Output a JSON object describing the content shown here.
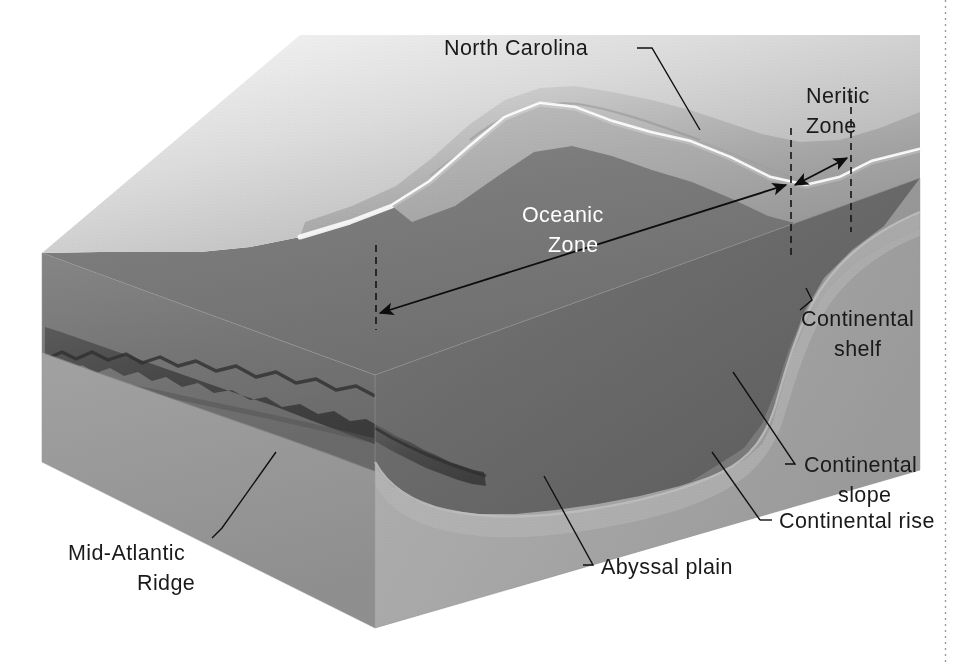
{
  "figure": {
    "background_color": "#ffffff",
    "width": 956,
    "height": 663
  },
  "palette": {
    "land_light": "#e8e8e8",
    "land_mid": "#c9c9c9",
    "land_shadow": "#9f9f9f",
    "coast_highlight": "#fdfdfd",
    "water_surface_top": "#b9b9b9",
    "water_surface_front": "#8e8e8e",
    "water_deep": "#6e6e6e",
    "water_deepest": "#5e5e5e",
    "seafloor_left_face": "#7e7e7e",
    "seafloor_front_face": "#9b9b9b",
    "block_left_side": "#c4c4c4",
    "block_right_side": "#a8a8a8",
    "ridge_dark": "#4a4a4a",
    "ridge_darker": "#3a3a3a",
    "label_black": "#1a1a1a",
    "label_white": "#ffffff",
    "leader_line": "#111111",
    "page_border": "#9a9a9a"
  },
  "labels": {
    "north_carolina": "North Carolina",
    "neritic_zone_line1": "Neritic",
    "neritic_zone_line2": "Zone",
    "oceanic_zone_line1": "Oceanic",
    "oceanic_zone_line2": "Zone",
    "continental_shelf_line1": "Continental",
    "continental_shelf_line2": "shelf",
    "continental_slope_line1": "Continental",
    "continental_slope_line2": "slope",
    "continental_rise": "Continental rise",
    "abyssal_plain": "Abyssal plain",
    "mid_atlantic_ridge_line1": "Mid-Atlantic",
    "mid_atlantic_ridge_line2": "Ridge"
  },
  "annotations": [
    {
      "name": "north-carolina",
      "text": "North Carolina",
      "text_color": "#1a1a1a",
      "leader": "elbow down-right to landmass ridge"
    },
    {
      "name": "neritic-zone",
      "text": "Neritic Zone",
      "text_color": "#1a1a1a",
      "measure": "double-headed arrow between shoreline and shelf break",
      "guide_lines": 2
    },
    {
      "name": "oceanic-zone",
      "text": "Oceanic Zone",
      "text_color": "#ffffff",
      "measure": "double-headed arrow from block front edge to shelf break",
      "guide_lines": 1
    },
    {
      "name": "continental-shelf",
      "text": "Continental shelf",
      "text_color": "#1a1a1a",
      "leader": "short line up-left onto shelf surface"
    },
    {
      "name": "continental-slope",
      "text": "Continental slope",
      "text_color": "#1a1a1a",
      "leader": "line up-left to steep slope face"
    },
    {
      "name": "continental-rise",
      "text": "Continental rise",
      "text_color": "#1a1a1a",
      "leader": "line up-left to base of slope"
    },
    {
      "name": "abyssal-plain",
      "text": "Abyssal plain",
      "text_color": "#1a1a1a",
      "leader": "line up-left onto flat deep seafloor"
    },
    {
      "name": "mid-atlantic-ridge",
      "text": "Mid-Atlantic Ridge",
      "text_color": "#1a1a1a",
      "leader": "line up-right to jagged ridge crest"
    }
  ],
  "features": [
    "landmass",
    "coastline-highlight",
    "continental-shelf",
    "shelf-break",
    "continental-slope",
    "continental-rise",
    "abyssal-plain",
    "mid-atlantic-ridge",
    "ocean-water-body",
    "block-left-face",
    "block-front-face"
  ]
}
